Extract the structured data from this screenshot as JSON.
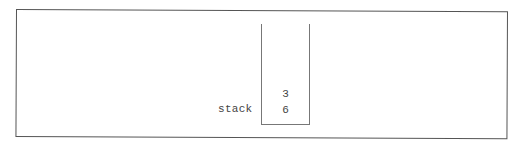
{
  "diagram": {
    "label": "stack",
    "stack": {
      "items_top_to_bottom": [
        "3",
        "6"
      ]
    }
  }
}
